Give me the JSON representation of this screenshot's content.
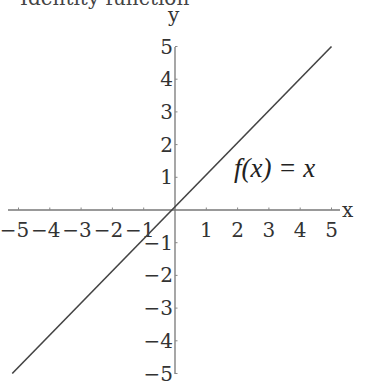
{
  "chart_data": {
    "type": "line",
    "title": "Identity function",
    "xlabel": "x",
    "ylabel": "y",
    "xlim": [
      -5,
      5
    ],
    "ylim": [
      -5,
      5
    ],
    "grid": false,
    "legend": null,
    "x_ticks": [
      "-5",
      "-4",
      "-3",
      "-2",
      "-1",
      "1",
      "2",
      "3",
      "4",
      "5"
    ],
    "y_ticks": [
      "5",
      "4",
      "3",
      "2",
      "1",
      "-1",
      "-2",
      "-3",
      "-4",
      "-5"
    ],
    "series": [
      {
        "name": "f(x) = x",
        "x": [
          -5.2,
          5.0
        ],
        "y": [
          -5.0,
          5.0
        ]
      }
    ],
    "annotations": [
      {
        "text": "f(x) = x",
        "x": 2.0,
        "y": 1.5
      }
    ]
  }
}
